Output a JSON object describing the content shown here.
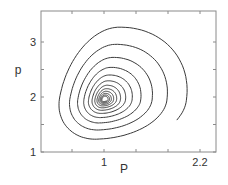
{
  "chart_data": {
    "type": "line",
    "title": "",
    "xlabel": "P",
    "ylabel": "p",
    "xlim": [
      0.35,
      2.45
    ],
    "ylim": [
      1,
      3.4
    ],
    "xticks": [
      {
        "value": 1,
        "label": "1"
      },
      {
        "value": 2.2,
        "label": "2.2"
      }
    ],
    "xminor": [
      0.6,
      1.4,
      1.8
    ],
    "yticks": [
      {
        "value": 1,
        "label": "1"
      },
      {
        "value": 2,
        "label": "2"
      },
      {
        "value": 3,
        "label": "3"
      }
    ],
    "yminor": [
      1.5,
      2.5
    ],
    "grid": false,
    "legend": null,
    "series": [
      {
        "name": "phase trajectory (spiral to equilibrium)",
        "description": "Counter-clockwise spiral starting near (1.95, 1.32), converging to the fixed point (1, 1.95)",
        "start": [
          1.95,
          1.32
        ],
        "equilibrium": [
          1.0,
          1.95
        ],
        "loop_extents": [
          {
            "top": 3.25,
            "left": 0.5,
            "bottom": 1.1,
            "right": 2.05
          },
          {
            "top": 2.93,
            "left": 0.6,
            "bottom": 1.22,
            "right": 1.77
          },
          {
            "top": 2.7,
            "left": 0.67,
            "bottom": 1.33,
            "right": 1.57
          },
          {
            "top": 2.55,
            "left": 0.73,
            "bottom": 1.42,
            "right": 1.44
          },
          {
            "top": 2.43,
            "left": 0.78,
            "bottom": 1.5,
            "right": 1.35
          }
        ],
        "color": "#3a3a3a"
      }
    ]
  },
  "colors": {
    "axis": "#8a8a8a",
    "curve": "#3a3a3a",
    "text": "#333333",
    "background": "#ffffff"
  }
}
